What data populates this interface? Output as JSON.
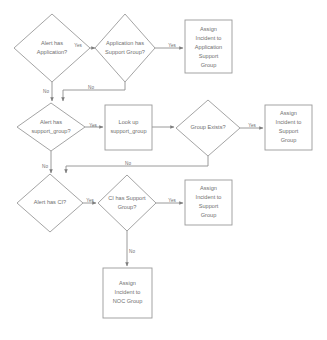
{
  "diagram": {
    "colors": {
      "shape_stroke": "#9a9a9a",
      "connector": "#8f8f8f",
      "text": "#6f6f6f",
      "background": "#ffffff"
    },
    "nodes": [
      {
        "id": "alert-has-application",
        "type": "decision",
        "lines": [
          "Alert has",
          "Application?"
        ],
        "cx": 52,
        "cy": 48,
        "rx": 38,
        "ry": 34
      },
      {
        "id": "application-has-support-group",
        "type": "decision",
        "lines": [
          "Application has",
          "Support Group?"
        ],
        "cx": 125,
        "cy": 48,
        "rx": 30,
        "ry": 34
      },
      {
        "id": "assign-incident-application-support-group",
        "type": "process",
        "lines": [
          "Assign",
          "Incident to",
          "Application",
          "Support",
          "Group"
        ],
        "x": 185,
        "y": 20,
        "w": 47,
        "h": 53
      },
      {
        "id": "alert-has-support-group",
        "type": "decision",
        "lines": [
          "Alert has",
          "support_group?"
        ],
        "cx": 51,
        "cy": 127,
        "rx": 34,
        "ry": 24
      },
      {
        "id": "look-up-support-group",
        "type": "process",
        "lines": [
          "Look up",
          "support_group"
        ],
        "x": 105,
        "y": 105,
        "w": 47,
        "h": 45
      },
      {
        "id": "group-exists",
        "type": "decision",
        "lines": [
          "Group Exists?"
        ],
        "cx": 208,
        "cy": 128,
        "rx": 32,
        "ry": 28
      },
      {
        "id": "assign-incident-support-group-row2",
        "type": "process",
        "lines": [
          "Assign",
          "Incident to",
          "Support",
          "Group"
        ],
        "x": 265,
        "y": 105,
        "w": 47,
        "h": 45
      },
      {
        "id": "alert-has-ci",
        "type": "decision",
        "lines": [
          "Alert has CI?"
        ],
        "cx": 50,
        "cy": 203,
        "rx": 33,
        "ry": 29
      },
      {
        "id": "ci-has-support-group",
        "type": "decision",
        "lines": [
          "CI has Support",
          "Group?"
        ],
        "cx": 127,
        "cy": 203,
        "rx": 29,
        "ry": 28
      },
      {
        "id": "assign-incident-support-group-row3",
        "type": "process",
        "lines": [
          "Assign",
          "Incident to",
          "Support",
          "Group"
        ],
        "x": 185,
        "y": 180,
        "w": 47,
        "h": 45
      },
      {
        "id": "assign-incident-noc-group",
        "type": "process",
        "lines": [
          "Assign",
          "Incident to",
          "NOC Group"
        ],
        "x": 103,
        "y": 268,
        "w": 49,
        "h": 50
      }
    ],
    "edges": [
      {
        "id": "e1",
        "from": "alert-has-application",
        "to": "application-has-support-group",
        "label": "Yes",
        "label_x": 78,
        "label_y": 46
      },
      {
        "id": "e2",
        "from": "application-has-support-group",
        "to": "assign-incident-application-support-group",
        "label": "Yes",
        "label_x": 172,
        "label_y": 46
      },
      {
        "id": "e3",
        "from": "alert-has-application",
        "to": "alert-has-support-group",
        "label": "No",
        "label_x": 46,
        "label_y": 92
      },
      {
        "id": "e4",
        "from": "application-has-support-group",
        "to": "alert-has-support-group",
        "label": "No",
        "label_x": 91,
        "label_y": 90
      },
      {
        "id": "e5",
        "from": "alert-has-support-group",
        "to": "look-up-support-group",
        "label": "Yes",
        "label_x": 93,
        "label_y": 126
      },
      {
        "id": "e6",
        "from": "look-up-support-group",
        "to": "group-exists",
        "label": "",
        "label_x": 164,
        "label_y": 122
      },
      {
        "id": "e7",
        "from": "group-exists",
        "to": "assign-incident-support-group-row2",
        "label": "Yes",
        "label_x": 252,
        "label_y": 126
      },
      {
        "id": "e8",
        "from": "alert-has-support-group",
        "to": "alert-has-ci",
        "label": "No",
        "label_x": 45,
        "label_y": 167
      },
      {
        "id": "e9",
        "from": "group-exists",
        "to": "ci-has-support-group",
        "label": "No",
        "label_x": 128,
        "label_y": 166
      },
      {
        "id": "e10",
        "from": "alert-has-ci",
        "to": "ci-has-support-group",
        "label": "Yes",
        "label_x": 90,
        "label_y": 201
      },
      {
        "id": "e11",
        "from": "ci-has-support-group",
        "to": "assign-incident-support-group-row3",
        "label": "Yes",
        "label_x": 172,
        "label_y": 201
      },
      {
        "id": "e12",
        "from": "ci-has-support-group",
        "to": "assign-incident-noc-group",
        "label": "No",
        "label_x": 132,
        "label_y": 252
      }
    ]
  }
}
